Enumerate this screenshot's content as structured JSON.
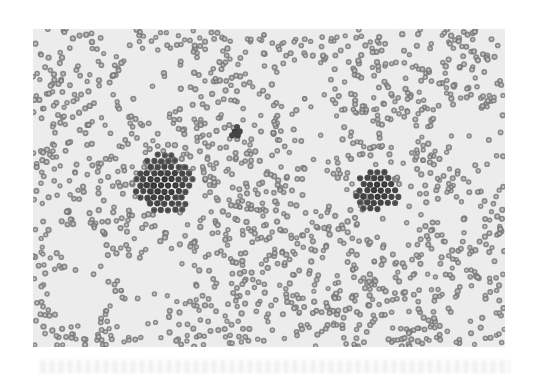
{
  "image": {
    "type": "grayscale micrograph",
    "subject": "blood smear with densely scattered red blood cells",
    "background_color": "#ececec",
    "cell_color": "#7a7a7a",
    "cluster_color": "#2e2e2e",
    "features": [
      {
        "name": "dark-cell-cluster-left",
        "center": [
          163,
          185
        ],
        "radius": 30
      },
      {
        "name": "dark-cell-cluster-right",
        "center": [
          377,
          190
        ],
        "radius": 24
      },
      {
        "name": "dark-spot-top-center",
        "center": [
          236,
          133
        ],
        "radius": 6
      }
    ]
  }
}
